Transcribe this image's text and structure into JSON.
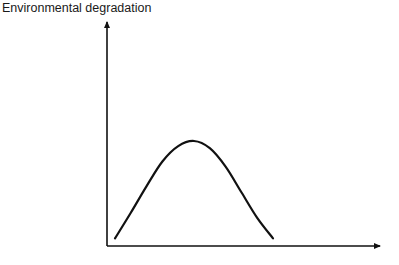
{
  "chart_data": {
    "type": "line",
    "title": "",
    "xlabel": "",
    "ylabel": "Environmental degradation",
    "grid": false,
    "legend": null,
    "x_ticks": [],
    "y_ticks": [],
    "x": [
      0,
      0.1,
      0.2,
      0.3,
      0.4,
      0.5,
      0.6,
      0.7,
      0.8,
      0.9,
      1.0
    ],
    "series": [
      {
        "name": "curve",
        "values": [
          0.05,
          0.3,
          0.56,
          0.8,
          0.95,
          1.0,
          0.93,
          0.75,
          0.5,
          0.25,
          0.05
        ]
      }
    ],
    "xlim": [
      0,
      1.75
    ],
    "ylim": [
      0,
      2.1
    ]
  },
  "axis": {
    "y_label": "Environmental degradation"
  }
}
